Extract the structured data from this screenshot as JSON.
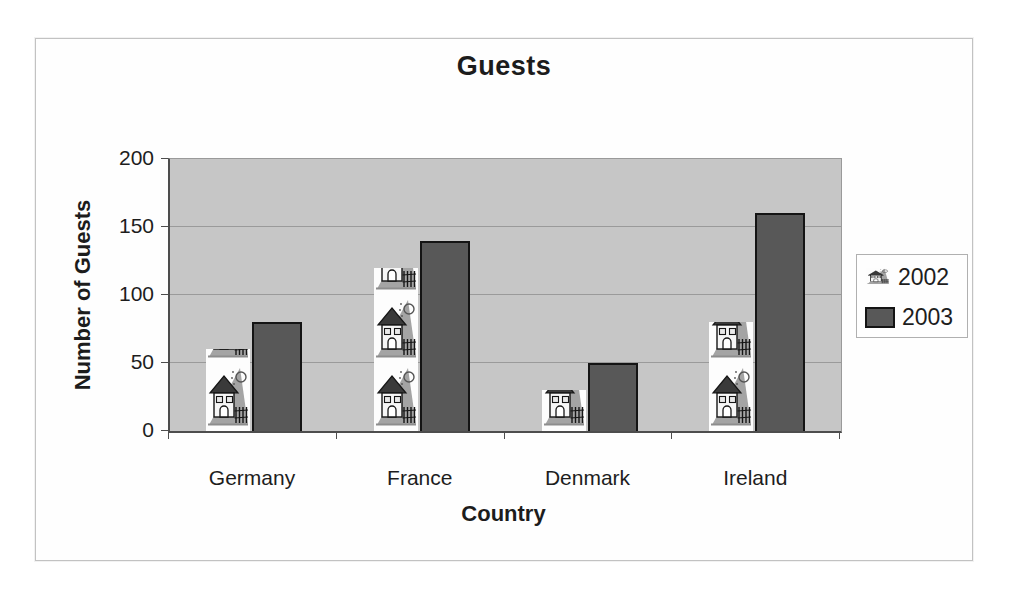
{
  "chart_data": {
    "type": "bar",
    "title": "Guests",
    "xlabel": "Country",
    "ylabel": "Number of Guests",
    "categories": [
      "Germany",
      "France",
      "Denmark",
      "Ireland"
    ],
    "series": [
      {
        "name": "2002",
        "style": "picture-stack-house",
        "values": [
          60,
          120,
          30,
          80
        ]
      },
      {
        "name": "2003",
        "style": "solid",
        "color": "#585858",
        "values": [
          80,
          140,
          50,
          160
        ]
      }
    ],
    "ylim": [
      0,
      200
    ],
    "yticks": [
      0,
      50,
      100,
      150,
      200
    ],
    "picture_unit": 50,
    "grid": "horizontal",
    "legend_position": "right",
    "plot_background": "#c6c6c6",
    "gridline_color": "#9a9a9a"
  },
  "legend": {
    "items": [
      {
        "label": "2002",
        "swatch": "house-picture-icon"
      },
      {
        "label": "2003",
        "swatch": "dark-gray-square"
      }
    ]
  }
}
